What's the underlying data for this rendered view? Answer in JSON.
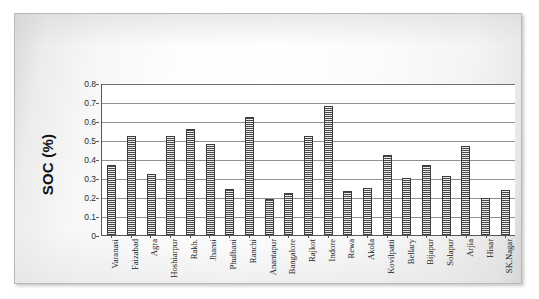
{
  "chart_data": {
    "type": "bar",
    "title": "",
    "xlabel": "",
    "ylabel": "SOC (%)",
    "ylim": [
      0,
      0.8
    ],
    "ytick_labels": [
      "0.8",
      "0.7",
      "0.6",
      "0.5",
      "0.4",
      "0.3",
      "0.2",
      "0.1",
      "0"
    ],
    "yticks": [
      0.8,
      0.7,
      0.6,
      0.5,
      0.4,
      0.3,
      0.2,
      0.1,
      0
    ],
    "grid": "horizontal",
    "legend": "none",
    "categories": [
      "Varanasi",
      "Faizabad",
      "Agra",
      "Hoshiarpur",
      "Rakh.",
      "Jhansi",
      "Phulbani",
      "Ranchi",
      "Anantapur",
      "Bangalore",
      "Rajkot",
      "Indore",
      "Rewa",
      "Akola",
      "Kovilpatti",
      "Bellary",
      "Bijapur",
      "Solapur",
      "Arjia",
      "Hisar",
      "SK.Nagar"
    ],
    "values": [
      0.37,
      0.52,
      0.32,
      0.52,
      0.56,
      0.48,
      0.24,
      0.62,
      0.19,
      0.22,
      0.52,
      0.68,
      0.23,
      0.25,
      0.42,
      0.3,
      0.37,
      0.31,
      0.47,
      0.195,
      0.235
    ],
    "bar_style": {
      "fill": "#9a9a9a",
      "pattern": "cross-hatch-dither",
      "border": "#3a3c3e"
    }
  },
  "figure": {
    "background": "#ffffff",
    "frame_border": "#b9b9b9",
    "axis_color": "#55595c",
    "gridline_color": "#8e9294",
    "text_color": "#1a1a1a"
  }
}
